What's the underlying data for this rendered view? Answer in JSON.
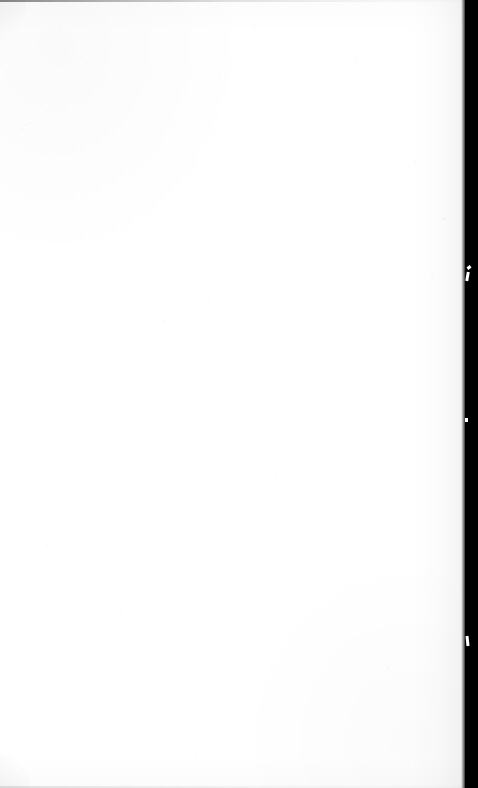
{
  "page": {
    "kind": "scanned-blank-page",
    "content_text": "",
    "width_px": 478,
    "height_px": 788
  },
  "colors": {
    "paper": "#ffffff",
    "paper_shade": "#fcfcfc",
    "gutter_band": "#000000",
    "edge_rule_top": "#282828",
    "edge_rule_bottom": "#969696",
    "speckle": "#000000"
  },
  "regions": {
    "paper_field": {
      "label": "",
      "x": 0,
      "y": 0,
      "width": 466,
      "height": 788
    },
    "gutter_band": {
      "label": "",
      "x": 465,
      "y": 0,
      "width": 13,
      "height": 788
    },
    "edge_rule_top": {
      "label": "",
      "x": 0,
      "y": 0,
      "width": 466,
      "height": 2
    },
    "edge_rule_bottom": {
      "label": "",
      "x": 0,
      "y": 786,
      "width": 466,
      "height": 2
    }
  },
  "speckles": [
    {
      "x": 96,
      "y": 44,
      "r": 1.2
    },
    {
      "x": 254,
      "y": 26,
      "r": 1.0
    },
    {
      "x": 22,
      "y": 129,
      "r": 1.1
    },
    {
      "x": 101,
      "y": 23,
      "r": 0.9
    },
    {
      "x": 60,
      "y": 31,
      "r": 0.8
    },
    {
      "x": 151,
      "y": 108,
      "r": 0.9
    },
    {
      "x": 219,
      "y": 78,
      "r": 1.0
    },
    {
      "x": 88,
      "y": 63,
      "r": 1.1
    },
    {
      "x": 30,
      "y": 123,
      "r": 0.9
    },
    {
      "x": 27,
      "y": 125,
      "r": 0.8
    },
    {
      "x": 443,
      "y": 71,
      "r": 1.0
    },
    {
      "x": 444,
      "y": 218,
      "r": 0.9
    },
    {
      "x": 357,
      "y": 61,
      "r": 0.8
    },
    {
      "x": 415,
      "y": 161,
      "r": 0.9
    },
    {
      "x": 283,
      "y": 98,
      "r": 0.8
    },
    {
      "x": 170,
      "y": 59,
      "r": 1.0
    },
    {
      "x": 442,
      "y": 220,
      "r": 0.9
    },
    {
      "x": 444,
      "y": 219,
      "r": 0.8
    },
    {
      "x": 164,
      "y": 321,
      "r": 0.9
    },
    {
      "x": 66,
      "y": 352,
      "r": 1.1
    },
    {
      "x": 333,
      "y": 303,
      "r": 0.9
    },
    {
      "x": 420,
      "y": 356,
      "r": 0.8
    },
    {
      "x": 276,
      "y": 478,
      "r": 0.9
    },
    {
      "x": 343,
      "y": 400,
      "r": 0.8
    },
    {
      "x": 122,
      "y": 424,
      "r": 0.9
    },
    {
      "x": 210,
      "y": 300,
      "r": 0.8
    },
    {
      "x": 460,
      "y": 421,
      "r": 1.0
    },
    {
      "x": 7,
      "y": 350,
      "r": 0.9
    },
    {
      "x": 9,
      "y": 458,
      "r": 0.8
    },
    {
      "x": 432,
      "y": 277,
      "r": 0.9
    },
    {
      "x": 47,
      "y": 546,
      "r": 0.9
    },
    {
      "x": 121,
      "y": 611,
      "r": 1.0
    },
    {
      "x": 260,
      "y": 713,
      "r": 0.9
    },
    {
      "x": 367,
      "y": 570,
      "r": 0.8
    },
    {
      "x": 104,
      "y": 771,
      "r": 0.9
    },
    {
      "x": 22,
      "y": 770,
      "r": 1.0
    },
    {
      "x": 314,
      "y": 747,
      "r": 0.9
    },
    {
      "x": 196,
      "y": 756,
      "r": 0.8
    },
    {
      "x": 409,
      "y": 762,
      "r": 0.9
    },
    {
      "x": 141,
      "y": 737,
      "r": 0.8
    },
    {
      "x": 230,
      "y": 560,
      "r": 0.8
    },
    {
      "x": 388,
      "y": 668,
      "r": 0.9
    }
  ]
}
